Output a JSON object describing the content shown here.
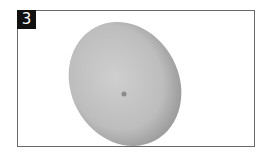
{
  "figure": {
    "label": "3",
    "shape": "ellipsoid-disc",
    "colors": {
      "frame": "#6a6a6a",
      "label_bg": "#111111",
      "label_text": "#ffffff",
      "fill_light": "#c9c9c9",
      "fill_dark": "#8e8e8e"
    }
  }
}
